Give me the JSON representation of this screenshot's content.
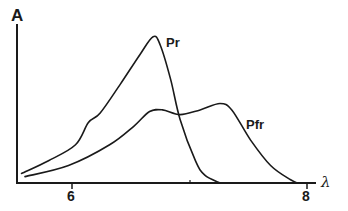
{
  "chart_data": {
    "type": "line",
    "title": "",
    "xlabel": "λ",
    "ylabel": "A",
    "x_ticks": [
      6,
      7,
      8
    ],
    "x_tick_labels": [
      "6",
      "",
      "8"
    ],
    "xlim": [
      5.55,
      8.07
    ],
    "ylim": [
      0,
      1
    ],
    "grid": false,
    "legend": "inline labels",
    "series": [
      {
        "name": "Pr",
        "x": [
          5.57,
          5.8,
          6.03,
          6.14,
          6.24,
          6.41,
          6.58,
          6.69,
          6.75,
          6.84,
          6.92,
          7.05,
          7.13,
          7.26
        ],
        "y": [
          0.06,
          0.14,
          0.24,
          0.38,
          0.44,
          0.62,
          0.81,
          0.92,
          0.87,
          0.65,
          0.4,
          0.14,
          0.05,
          0.0
        ]
      },
      {
        "name": "Pfr",
        "x": [
          5.6,
          5.97,
          6.32,
          6.53,
          6.66,
          6.77,
          6.92,
          7.09,
          7.26,
          7.36,
          7.52,
          7.69,
          7.86,
          7.92
        ],
        "y": [
          0.04,
          0.11,
          0.24,
          0.36,
          0.45,
          0.46,
          0.43,
          0.46,
          0.5,
          0.46,
          0.27,
          0.11,
          0.02,
          0.0
        ]
      }
    ],
    "annotations": [
      "Pr",
      "Pfr"
    ]
  },
  "labels": {
    "y_axis": "A",
    "x_axis": "λ",
    "tick_6": "6",
    "tick_8": "8",
    "series_pr": "Pr",
    "series_pfr": "Pfr"
  },
  "colors": {
    "line": "#1a1a1a",
    "background": "#ffffff"
  }
}
